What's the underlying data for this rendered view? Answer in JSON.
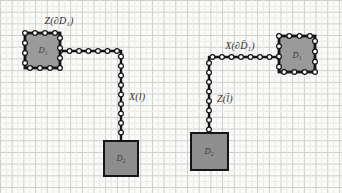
{
  "page": {
    "background": "#fbfbf9",
    "grid_major_color": "#c9cec9",
    "grid_minor_color": "#e7eae6",
    "grid_step_px": 11.7
  },
  "diagram": {
    "colors": {
      "stroke": "#151515",
      "boundary_square_fill": "#9a9a9a",
      "solid_square_fill": "#8e8e8e",
      "bead_fill": "#fcfcfc",
      "label_color": "#2e2e2e"
    },
    "bead_spacing": 9.5,
    "figures": [
      {
        "id": "left",
        "boundary_square": {
          "x": 25,
          "y": 33,
          "size": 35,
          "label": "D₁",
          "label_x": 43,
          "label_y": 53
        },
        "solid_square": {
          "x": 104,
          "y": 141,
          "w": 34,
          "h": 35,
          "label": "D₂",
          "label_x": 121,
          "label_y": 161
        },
        "chain": {
          "points": [
            [
              60,
              51
            ],
            [
              121,
              51
            ],
            [
              121,
              141
            ]
          ]
        },
        "boundary_label": {
          "text": "Z(∂D₁)",
          "x": 59,
          "y": 24,
          "anchor": "middle"
        },
        "chain_label": {
          "text": "X(l)",
          "x": 129,
          "y": 100,
          "anchor": "start"
        }
      },
      {
        "id": "right",
        "boundary_square": {
          "x": 279,
          "y": 36,
          "size": 36,
          "label": "D̄₁",
          "label_x": 297,
          "label_y": 58
        },
        "solid_square": {
          "x": 191,
          "y": 133,
          "w": 37,
          "h": 37,
          "label": "D̄₂",
          "label_x": 209,
          "label_y": 154
        },
        "chain": {
          "points": [
            [
              279,
              57
            ],
            [
              209,
              57
            ],
            [
              209,
              133
            ]
          ]
        },
        "boundary_label": {
          "text": "X(∂D̄₁)",
          "x": 240,
          "y": 49,
          "anchor": "middle"
        },
        "chain_label": {
          "text": "Z(l̄)",
          "x": 217,
          "y": 102,
          "anchor": "start"
        }
      }
    ]
  }
}
